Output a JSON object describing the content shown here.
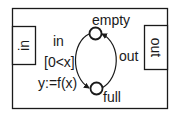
{
  "diagram": {
    "type": "state-machine",
    "colors": {
      "stroke": "#1a1a1a",
      "background": "#ffffff"
    },
    "ports": {
      "input": {
        "label": "in"
      },
      "output": {
        "label": "out"
      }
    },
    "states": [
      {
        "id": "empty",
        "label": "empty"
      },
      {
        "id": "full",
        "label": "full"
      }
    ],
    "transitions": [
      {
        "from": "empty",
        "to": "full",
        "trigger": "in",
        "guard": "[0<x]",
        "action": "y:=f(x)"
      },
      {
        "from": "full",
        "to": "empty",
        "trigger": "out"
      }
    ]
  }
}
